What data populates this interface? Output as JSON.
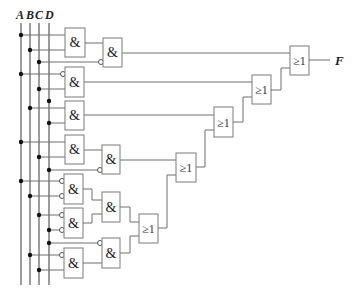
{
  "diagram": {
    "type": "combinational-logic-circuit",
    "inputs": [
      "A",
      "B",
      "C",
      "D"
    ],
    "output": "F",
    "and_symbol": "&",
    "or_symbol": "≥1",
    "colors": {
      "wire": "#6e6e6e",
      "gate_border": "#7a7a7a",
      "dot": "#111111",
      "background": "#ffffff"
    },
    "gates": [
      {
        "id": "and1",
        "type": "AND",
        "label": "&",
        "inputs": [
          "A",
          "B"
        ]
      },
      {
        "id": "and2",
        "type": "AND",
        "label": "&",
        "inputs": [
          "and1",
          "C'"
        ]
      },
      {
        "id": "and3",
        "type": "AND",
        "label": "&",
        "inputs": [
          "A'",
          "C"
        ]
      },
      {
        "id": "and4",
        "type": "AND",
        "label": "&",
        "inputs": [
          "B",
          "D"
        ]
      },
      {
        "id": "and5",
        "type": "AND",
        "label": "&",
        "inputs": [
          "A",
          "C"
        ]
      },
      {
        "id": "and6",
        "type": "AND",
        "label": "&",
        "inputs": [
          "and5",
          "D'"
        ]
      },
      {
        "id": "and7",
        "type": "AND",
        "label": "&",
        "inputs": [
          "A'",
          "B'"
        ]
      },
      {
        "id": "and8",
        "type": "AND",
        "label": "&",
        "inputs": [
          "C'",
          "D'"
        ]
      },
      {
        "id": "and9",
        "type": "AND",
        "label": "&",
        "inputs": [
          "and7",
          "and8"
        ]
      },
      {
        "id": "and10",
        "type": "AND",
        "label": "&",
        "inputs": [
          "B'",
          "C"
        ]
      },
      {
        "id": "and11",
        "type": "AND",
        "label": "&",
        "inputs": [
          "D'",
          "and10"
        ]
      },
      {
        "id": "or1",
        "type": "OR",
        "label": "≥1",
        "inputs": [
          "and9",
          "and11"
        ]
      },
      {
        "id": "or2",
        "type": "OR",
        "label": "≥1",
        "inputs": [
          "and6",
          "or1"
        ]
      },
      {
        "id": "or3",
        "type": "OR",
        "label": "≥1",
        "inputs": [
          "and4",
          "or2"
        ]
      },
      {
        "id": "or4",
        "type": "OR",
        "label": "≥1",
        "inputs": [
          "and3",
          "or3"
        ]
      },
      {
        "id": "or5",
        "type": "OR",
        "label": "≥1",
        "inputs": [
          "and2",
          "or4"
        ]
      }
    ]
  }
}
